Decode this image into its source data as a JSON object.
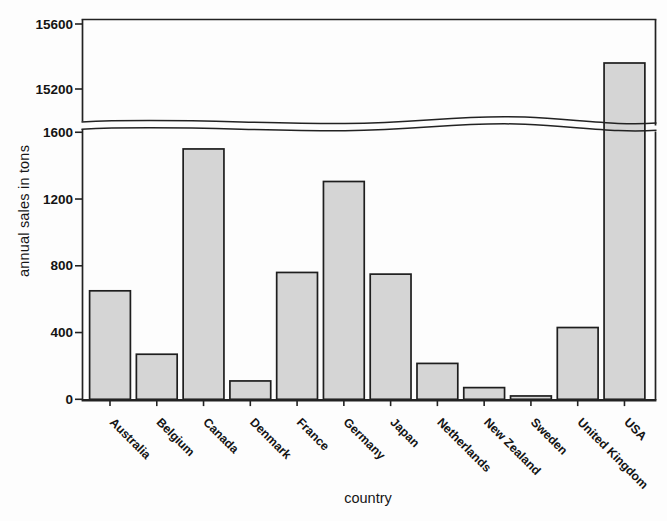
{
  "chart_data": {
    "type": "bar",
    "title": "",
    "xlabel": "country",
    "ylabel": "annual sales in tons",
    "categories": [
      "Australia",
      "Belgium",
      "Canada",
      "Denmark",
      "France",
      "Germany",
      "Japan",
      "Netherlands",
      "New Zealand",
      "Sweden",
      "United Kingdom",
      "USA"
    ],
    "values": [
      650,
      270,
      1500,
      110,
      760,
      1305,
      750,
      215,
      70,
      20,
      430,
      15360
    ],
    "axis_break": true,
    "lower_axis": {
      "range": [
        0,
        1600
      ],
      "ticks": [
        0,
        400,
        800,
        1200,
        1600
      ]
    },
    "upper_axis": {
      "range": [
        14980,
        15600
      ],
      "ticks": [
        15200,
        15600
      ]
    },
    "grid": false,
    "legend": false,
    "label_rotation_deg": 45,
    "bar_fill": "#d5d5d5",
    "bar_border": "#1e1e1e",
    "axis_color": "#222222",
    "text_color": "#141414"
  }
}
